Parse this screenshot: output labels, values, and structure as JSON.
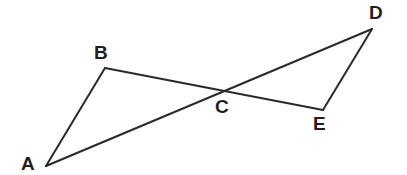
{
  "figure": {
    "background_color": "#ffffff",
    "stroke_color": "#2a2a2a",
    "stroke_width": 2,
    "label_color": "#1f1f1f",
    "canvas": {
      "width": 407,
      "height": 175
    },
    "artifact_text": "...",
    "points": [
      {
        "id": "A",
        "label": "A",
        "x": 46,
        "y": 166,
        "label_x": 21,
        "label_y": 154
      },
      {
        "id": "B",
        "label": "B",
        "x": 105,
        "y": 68,
        "label_x": 94,
        "label_y": 43
      },
      {
        "id": "C",
        "label": "C",
        "x": 225,
        "y": 91,
        "label_x": 215,
        "label_y": 97
      },
      {
        "id": "D",
        "label": "D",
        "x": 372,
        "y": 29,
        "label_x": 369,
        "label_y": 3
      },
      {
        "id": "E",
        "label": "E",
        "x": 323,
        "y": 110,
        "label_x": 313,
        "label_y": 114
      }
    ],
    "segments": [
      {
        "id": "AB",
        "from": "A",
        "to": "B"
      },
      {
        "id": "BE",
        "from": "B",
        "to": "E"
      },
      {
        "id": "AD",
        "from": "A",
        "to": "D"
      },
      {
        "id": "DE",
        "from": "D",
        "to": "E"
      }
    ],
    "triangles": [
      {
        "id": "ABC",
        "vertices": [
          "A",
          "B",
          "C"
        ]
      },
      {
        "id": "CDE",
        "vertices": [
          "C",
          "D",
          "E"
        ]
      }
    ]
  }
}
